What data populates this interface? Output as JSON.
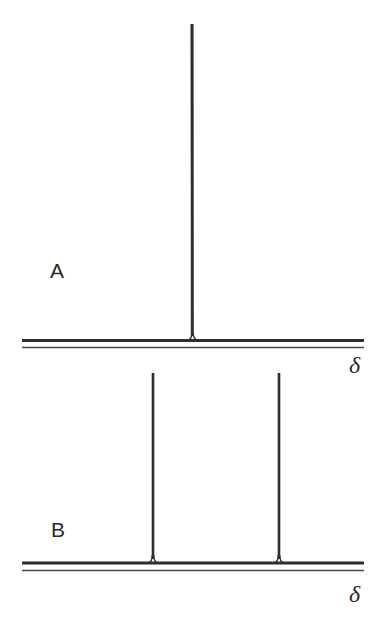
{
  "figure": {
    "colors": {
      "line": "#2e2e2e",
      "axis": "#4a4a4a",
      "background": "#ffffff"
    },
    "panels": [
      {
        "id": "A",
        "label": "A",
        "axis_label": "δ",
        "peaks": [
          {
            "x": 192,
            "top": 24
          }
        ],
        "baseline_y": 340.5,
        "axis_y": 347.5,
        "x_start": 22,
        "x_end": 364
      },
      {
        "id": "B",
        "label": "B",
        "axis_label": "δ",
        "peaks": [
          {
            "x": 153,
            "top": 373
          },
          {
            "x": 279,
            "top": 373
          }
        ],
        "baseline_y": 563,
        "axis_y": 570.5,
        "x_start": 22,
        "x_end": 364
      }
    ]
  }
}
